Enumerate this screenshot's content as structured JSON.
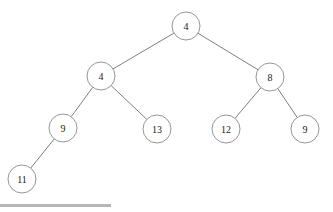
{
  "diagram": {
    "type": "binary-tree",
    "title": "",
    "stroke_color": "#8a8a8a",
    "edge_color": "#6f6f6f",
    "label_color": "#1a1a1a",
    "node_fill": "#ffffff",
    "node_radius": 14,
    "nodes": [
      {
        "id": "root",
        "label": "4",
        "cx": 186,
        "cy": 26,
        "level": 0
      },
      {
        "id": "n-l",
        "label": "4",
        "cx": 101,
        "cy": 76,
        "level": 1
      },
      {
        "id": "n-r",
        "label": "8",
        "cx": 270,
        "cy": 77,
        "level": 1
      },
      {
        "id": "n-ll",
        "label": "9",
        "cx": 63,
        "cy": 128,
        "level": 2
      },
      {
        "id": "n-lr",
        "label": "13",
        "cx": 157,
        "cy": 129,
        "level": 2
      },
      {
        "id": "n-rl",
        "label": "12",
        "cx": 226,
        "cy": 129,
        "level": 2
      },
      {
        "id": "n-rr",
        "label": "9",
        "cx": 305,
        "cy": 129,
        "level": 2
      },
      {
        "id": "n-lll",
        "label": "11",
        "cx": 22,
        "cy": 179,
        "level": 3
      }
    ],
    "edges": [
      {
        "from": "root",
        "to": "n-l"
      },
      {
        "from": "root",
        "to": "n-r"
      },
      {
        "from": "n-l",
        "to": "n-ll"
      },
      {
        "from": "n-l",
        "to": "n-lr"
      },
      {
        "from": "n-r",
        "to": "n-rl"
      },
      {
        "from": "n-r",
        "to": "n-rr"
      },
      {
        "from": "n-ll",
        "to": "n-lll"
      }
    ]
  },
  "footer": {
    "rule_color": "#b6b6b8",
    "rule_x": 0,
    "rule_y": 204,
    "rule_width": 111,
    "rule_height": 3
  }
}
